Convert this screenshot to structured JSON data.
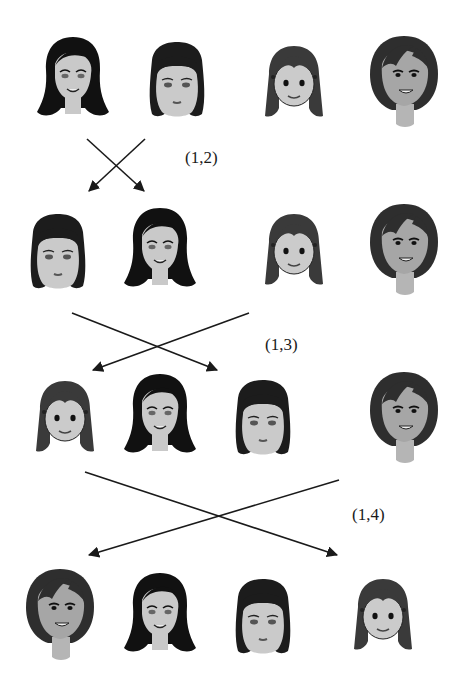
{
  "diagram": {
    "type": "permutation-transpositions",
    "colors": {
      "ink": "#1a1a1a",
      "skin_light": "#c9c9c9",
      "skin_tan": "#a8a8a8",
      "hair_black": "#111111",
      "hair_dark": "#2a2a2a",
      "hair_gray": "#444444"
    },
    "faces": {
      "A": {
        "description": "long black flipped hair, smiling"
      },
      "B": {
        "description": "short dark bob, round face"
      },
      "C": {
        "description": "long straight hair, pigtail clips, simple face"
      },
      "D": {
        "description": "dark bob hair, tan face, smiling"
      }
    },
    "rows": [
      {
        "order": [
          "A",
          "B",
          "C",
          "D"
        ]
      },
      {
        "order": [
          "B",
          "A",
          "C",
          "D"
        ]
      },
      {
        "order": [
          "C",
          "A",
          "B",
          "D"
        ]
      },
      {
        "order": [
          "D",
          "A",
          "B",
          "C"
        ]
      }
    ],
    "swaps": [
      {
        "label": "(1,2)"
      },
      {
        "label": "(1,3)"
      },
      {
        "label": "(1,4)"
      }
    ]
  }
}
